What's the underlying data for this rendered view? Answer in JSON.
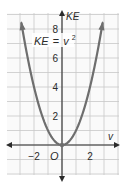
{
  "chart_data": {
    "type": "line",
    "title": "",
    "equation_label": "KE = v²",
    "equation_parts": {
      "lhs": "KE",
      "eq": "=",
      "base": "v",
      "exp": "2"
    },
    "xlabel": "v",
    "ylabel": "KE",
    "origin_label": "O",
    "x_ticks": [
      {
        "value": -2,
        "label": "−2"
      },
      {
        "value": 2,
        "label": "2"
      }
    ],
    "y_ticks": [
      {
        "value": 2,
        "label": "2"
      },
      {
        "value": 4,
        "label": "4"
      },
      {
        "value": 6,
        "label": "6"
      },
      {
        "value": 8,
        "label": "8"
      }
    ],
    "xlim": [
      -4,
      4
    ],
    "ylim": [
      -2,
      9
    ],
    "grid": true,
    "series": [
      {
        "name": "KE = v^2",
        "x": [
          -2.9,
          -2.5,
          -2,
          -1.5,
          -1,
          -0.5,
          0,
          0.5,
          1,
          1.5,
          2,
          2.5,
          2.9
        ],
        "y": [
          8.41,
          6.25,
          4,
          2.25,
          1,
          0.25,
          0,
          0.25,
          1,
          2.25,
          4,
          6.25,
          8.41
        ]
      }
    ],
    "vertex_point": {
      "x": 0,
      "y": 0
    },
    "colors": {
      "curve": "#6e6e6e",
      "axis": "#2b2b2b",
      "grid": "#c8c8c8",
      "text": "#2b2b2b"
    }
  }
}
